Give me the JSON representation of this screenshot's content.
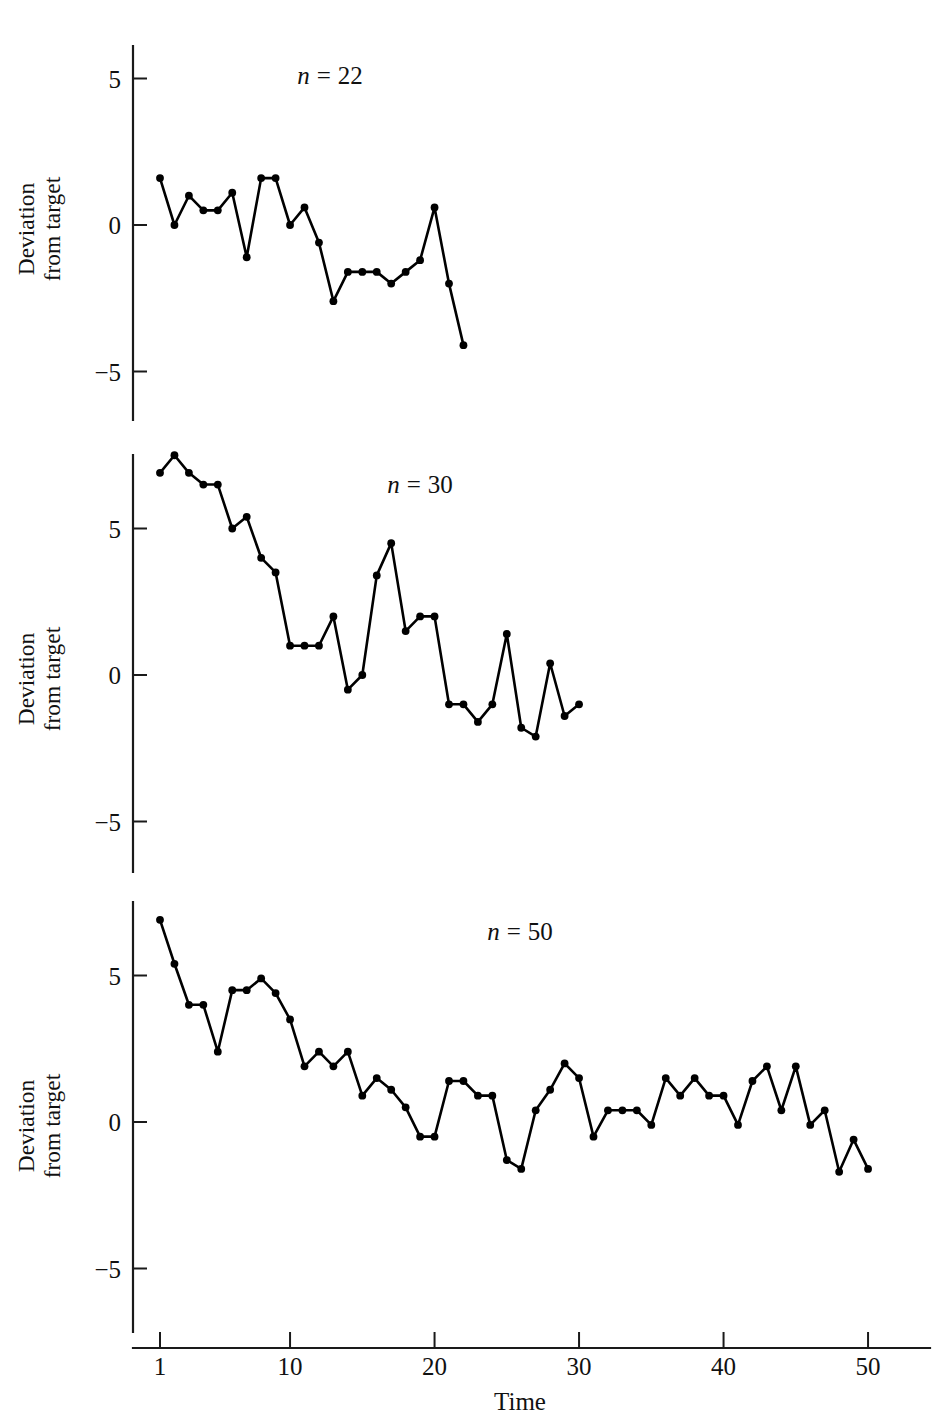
{
  "figure": {
    "background_color": "#ffffff",
    "line_color": "#000000",
    "marker_color": "#000000",
    "axis_color": "#1a1a1a",
    "xlabel": "Time",
    "ylabel_line1": "Deviation",
    "ylabel_line2": "from target",
    "x_tick_labels": [
      "1",
      "10",
      "20",
      "30",
      "40",
      "50"
    ],
    "x_tick_values": [
      1,
      10,
      20,
      30,
      40,
      50
    ],
    "y_tick_labels": [
      "5",
      "0",
      "−5"
    ],
    "y_tick_values": [
      5,
      0,
      -5
    ]
  },
  "chart_data": [
    {
      "type": "line",
      "title": "n = 22",
      "annotation_prefix": "n",
      "annotation_equals": "=",
      "annotation_value": "22",
      "n": 22,
      "xlabel": "",
      "ylabel": "Deviation from target",
      "xlim": [
        0,
        51
      ],
      "ylim": [
        -7,
        7
      ],
      "xticks": [
        1,
        10,
        20,
        30,
        40,
        50
      ],
      "yticks": [
        5,
        0,
        -5
      ],
      "grid": false,
      "legend": "none",
      "x": [
        1,
        2,
        3,
        4,
        5,
        6,
        7,
        8,
        9,
        10,
        11,
        12,
        13,
        14,
        15,
        16,
        17,
        18,
        19,
        20,
        21,
        22
      ],
      "values": [
        1.6,
        0.0,
        1.0,
        0.5,
        0.5,
        1.1,
        -1.1,
        1.6,
        1.6,
        0.0,
        0.6,
        -0.6,
        -2.6,
        -1.6,
        -1.6,
        -1.6,
        -2.0,
        -1.6,
        -1.2,
        0.6,
        -2.0,
        -4.1
      ]
    },
    {
      "type": "line",
      "title": "n = 30",
      "annotation_prefix": "n",
      "annotation_equals": "=",
      "annotation_value": "30",
      "n": 30,
      "xlabel": "",
      "ylabel": "Deviation from target",
      "xlim": [
        0,
        51
      ],
      "ylim": [
        -7,
        7
      ],
      "xticks": [
        1,
        10,
        20,
        30,
        40,
        50
      ],
      "yticks": [
        5,
        0,
        -5
      ],
      "grid": false,
      "legend": "none",
      "x": [
        1,
        2,
        3,
        4,
        5,
        6,
        7,
        8,
        9,
        10,
        11,
        12,
        13,
        14,
        15,
        16,
        17,
        18,
        19,
        20,
        21,
        22,
        23,
        24,
        25,
        26,
        27,
        28,
        29,
        30
      ],
      "values": [
        6.9,
        7.5,
        6.9,
        6.5,
        6.5,
        5.0,
        5.4,
        4.0,
        3.5,
        1.0,
        1.0,
        1.0,
        2.0,
        -0.5,
        0.0,
        3.4,
        4.5,
        1.5,
        2.0,
        2.0,
        -1.0,
        -1.0,
        -1.6,
        -1.0,
        1.4,
        -1.8,
        -2.1,
        0.4,
        -1.4,
        -1.0
      ]
    },
    {
      "type": "line",
      "title": "n = 50",
      "annotation_prefix": "n",
      "annotation_equals": "=",
      "annotation_value": "50",
      "n": 50,
      "xlabel": "",
      "ylabel": "Deviation from target",
      "xlim": [
        0,
        51
      ],
      "ylim": [
        -7,
        7
      ],
      "xticks": [
        1,
        10,
        20,
        30,
        40,
        50
      ],
      "yticks": [
        5,
        0,
        -5
      ],
      "grid": false,
      "legend": "none",
      "x": [
        1,
        2,
        3,
        4,
        5,
        6,
        7,
        8,
        9,
        10,
        11,
        12,
        13,
        14,
        15,
        16,
        17,
        18,
        19,
        20,
        21,
        22,
        23,
        24,
        25,
        26,
        27,
        28,
        29,
        30,
        31,
        32,
        33,
        34,
        35,
        36,
        37,
        38,
        39,
        40,
        41,
        42,
        43,
        44,
        45,
        46,
        47,
        48,
        49,
        50
      ],
      "values": [
        6.9,
        5.4,
        4.0,
        4.0,
        2.4,
        4.5,
        4.5,
        4.9,
        4.4,
        3.5,
        1.9,
        2.4,
        1.9,
        2.4,
        0.9,
        1.5,
        1.1,
        0.5,
        -0.5,
        -0.5,
        1.4,
        1.4,
        0.9,
        0.9,
        -1.3,
        -1.6,
        0.4,
        1.1,
        2.0,
        1.5,
        -0.5,
        0.4,
        0.4,
        0.4,
        -0.1,
        1.5,
        0.9,
        1.5,
        0.9,
        0.9,
        -0.1,
        1.4,
        1.9,
        0.4,
        1.9,
        -0.1,
        0.4,
        -1.7,
        -0.6,
        -1.6
      ]
    }
  ]
}
